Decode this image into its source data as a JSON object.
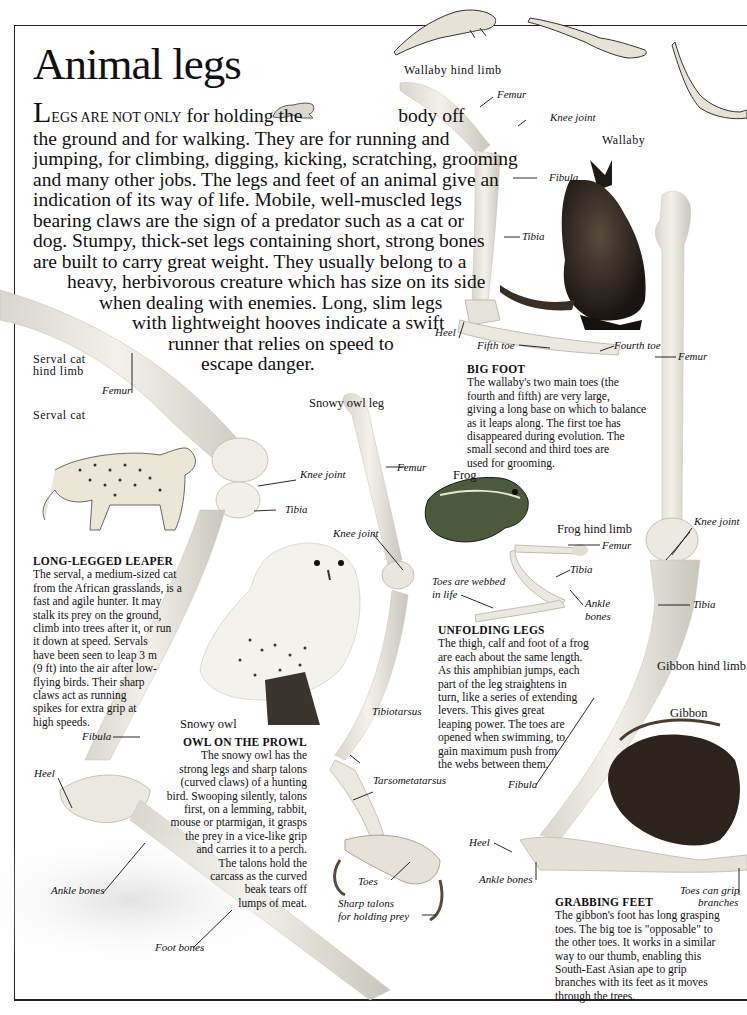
{
  "page": {
    "title": "Animal legs",
    "intro": {
      "drop_cap": "L",
      "small_caps": "EGS ARE NOT ONLY",
      "lines": [
        "for holding the",
        "body off",
        "the ground and for walking. They are for running and",
        "jumping, for climbing, digging, kicking, scratching, grooming",
        "and many other jobs. The legs and feet of an animal give an",
        "indication of its way of life. Mobile, well-muscled legs",
        "bearing claws are the sign of a predator such as a cat or",
        "dog. Stumpy, thick-set legs containing short, strong bones",
        "are built to carry great weight. They usually belong to a",
        "heavy, herbivorous creature which has size on its side",
        "when dealing with enemies. Long, slim legs",
        "with lightweight hooves indicate a swift",
        "runner that relies on speed to",
        "escape danger."
      ]
    },
    "wallaby": {
      "section_label": "Wallaby hind limb",
      "animal_label": "Wallaby",
      "labels": {
        "femur": "Femur",
        "knee_joint": "Knee joint",
        "fibula": "Fibula",
        "tibia": "Tibia",
        "heel": "Heel",
        "fifth_toe": "Fifth toe",
        "fourth_toe": "Fourth toe"
      },
      "caption_head": "BIG FOOT",
      "caption_lines": [
        "The wallaby's two main toes (the",
        "fourth and fifth) are very large,",
        "giving a long base on which to balance",
        "as it leaps along. The first toe has",
        "disappeared during evolution. The",
        "small second and third toes are",
        "used for grooming."
      ]
    },
    "serval": {
      "section_label_1": "Serval cat",
      "section_label_2": "hind limb",
      "animal_label": "Serval cat",
      "labels": {
        "femur": "Femur",
        "knee_joint": "Knee joint",
        "tibia": "Tibia",
        "fibula": "Fibula",
        "heel": "Heel",
        "ankle_bones": "Ankle bones",
        "foot_bones": "Foot bones"
      },
      "caption_head": "LONG-LEGGED LEAPER",
      "caption_lines": [
        "The serval, a medium-sized cat",
        "from the African grasslands, is a",
        "fast and agile hunter. It may",
        "stalk its prey on the ground,",
        "climb into trees after it, or run",
        "it down at speed. Servals",
        "have been seen to leap 3 m",
        "(9 ft) into the air after low-",
        "flying birds. Their sharp",
        "claws act as running",
        "spikes for extra grip at",
        "high speeds."
      ]
    },
    "owl": {
      "section_label": "Snowy owl leg",
      "animal_label": "Snowy owl",
      "labels": {
        "femur": "Femur",
        "knee_joint": "Knee joint",
        "tibiotarsus": "Tibiotarsus",
        "tarsometatarsus": "Tarsometatarsus",
        "toes": "Toes",
        "talons_1": "Sharp talons",
        "talons_2": "for holding prey"
      },
      "caption_head": "OWL ON THE PROWL",
      "caption_lines": [
        "The snowy owl has the",
        "strong legs and sharp talons",
        "(curved claws) of a hunting",
        "bird. Swooping silently, talons",
        "first, on a lemming, rabbit,",
        "mouse or ptarmigan, it grasps",
        "the prey in a vice-like grip",
        "and carries it to a perch.",
        "The talons hold the",
        "carcass as the curved",
        "beak tears off",
        "lumps of meat."
      ]
    },
    "frog": {
      "animal_label": "Frog",
      "section_label": "Frog hind limb",
      "labels": {
        "femur": "Femur",
        "tibia": "Tibia",
        "toes_1": "Toes are webbed",
        "toes_2": "in life",
        "ankle_1": "Ankle",
        "ankle_2": "bones"
      },
      "caption_head": "UNFOLDING LEGS",
      "caption_lines": [
        "The thigh, calf and foot of a frog",
        "are each about the same length.",
        "As this amphibian jumps, each",
        "part of the leg straightens in",
        "turn, like a series of extending",
        "levers. This gives great",
        "leaping power. The toes are",
        "opened when swimming, to",
        "gain maximum push from",
        "the webs between them."
      ]
    },
    "gibbon": {
      "section_label": "Gibbon hind limb",
      "animal_label": "Gibbon",
      "labels": {
        "femur": "Femur",
        "knee_joint": "Knee joint",
        "tibia": "Tibia",
        "fibula": "Fibula",
        "heel": "Heel",
        "ankle_bones": "Ankle bones",
        "toes_1": "Toes can grip",
        "toes_2": "branches"
      },
      "caption_head": "GRABBING FEET",
      "caption_lines": [
        "The gibbon's foot has long grasping",
        "toes. The big toe is \"opposable\" to",
        "the other toes. It works in a similar",
        "way to our thumb, enabling this",
        "South-East Asian ape to grip",
        "branches with its feet as it moves",
        "through the trees."
      ]
    }
  }
}
